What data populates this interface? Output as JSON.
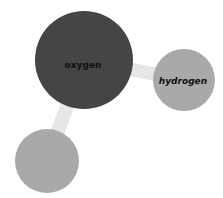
{
  "diagram": {
    "nodes": [
      {
        "id": "oxygen",
        "label": "oxygen",
        "cx": 84,
        "cy": 60,
        "r": 49,
        "color": "#454545"
      },
      {
        "id": "hydrogen",
        "label": "hydrogen",
        "cx": 184,
        "cy": 80,
        "r": 31,
        "color": "#a9a9a9"
      },
      {
        "id": "unlabeled",
        "label": "",
        "cx": 47,
        "cy": 161,
        "r": 32,
        "color": "#a9a9a9"
      }
    ],
    "links": [
      {
        "source": "oxygen",
        "target": "hydrogen",
        "color": "#e6e6e6"
      },
      {
        "source": "oxygen",
        "target": "unlabeled",
        "color": "#e6e6e6"
      }
    ]
  }
}
